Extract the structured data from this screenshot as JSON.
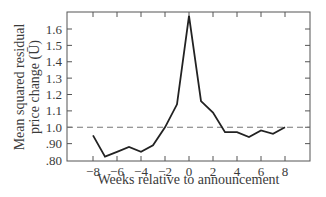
{
  "chart_data": {
    "type": "line",
    "title": "",
    "xlabel": "Weeks relative to announcement",
    "ylabel_line1": "Mean squared residual",
    "ylabel_line2": "price change (Ū)",
    "x": [
      -8,
      -7,
      -6,
      -5,
      -4,
      -3,
      -2,
      -1,
      0,
      1,
      2,
      3,
      4,
      5,
      6,
      7,
      8
    ],
    "series": [
      {
        "name": "Mean squared residual price change",
        "values": [
          0.95,
          0.82,
          0.85,
          0.88,
          0.85,
          0.89,
          1.0,
          1.14,
          1.68,
          1.16,
          1.09,
          0.97,
          0.97,
          0.94,
          0.98,
          0.96,
          1.0
        ]
      }
    ],
    "reference_line": {
      "y": 1.0,
      "style": "dashed"
    },
    "xlim": [
      -10,
      10
    ],
    "ylim": [
      0.8,
      1.7
    ],
    "xticks": [
      -8,
      -6,
      -4,
      -2,
      0,
      2,
      4,
      6,
      8
    ],
    "yticks": [
      0.8,
      0.9,
      1.0,
      1.1,
      1.2,
      1.3,
      1.4,
      1.5,
      1.6
    ],
    "ytick_labels": [
      ".80",
      ".90",
      "1.0",
      "1.1",
      "1.2",
      "1.3",
      "1.4",
      "1.5",
      "1.6"
    ],
    "grid": false,
    "legend": "none"
  },
  "colors": {
    "line": "#222222",
    "axis": "#555555",
    "dash": "#777777",
    "text": "#3a3a3a"
  }
}
